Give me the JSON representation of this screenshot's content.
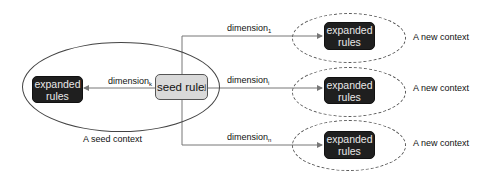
{
  "diagram": {
    "seed_context": {
      "label": "A seed context",
      "seed_rule": {
        "text": "seed rule",
        "subscript": "j"
      },
      "expanded_rules": {
        "line1": "expanded",
        "line2": "rules"
      },
      "edge": {
        "text": "dimension",
        "subscript": "k"
      }
    },
    "new_contexts": [
      {
        "label": "A new context",
        "expanded_rules": {
          "line1": "expanded",
          "line2": "rules"
        },
        "edge": {
          "text": "dimension",
          "subscript": "1"
        }
      },
      {
        "label": "A new context",
        "expanded_rules": {
          "line1": "expanded",
          "line2": "rules"
        },
        "edge": {
          "text": "dimension",
          "subscript": "i"
        }
      },
      {
        "label": "A new context",
        "expanded_rules": {
          "line1": "expanded",
          "line2": "rules"
        },
        "edge": {
          "text": "dimension",
          "subscript": "n"
        }
      }
    ],
    "colors": {
      "expanded_box_fill": "#1f1f1f",
      "seed_box_fill": "#d9d9d9",
      "line": "#555555"
    }
  }
}
